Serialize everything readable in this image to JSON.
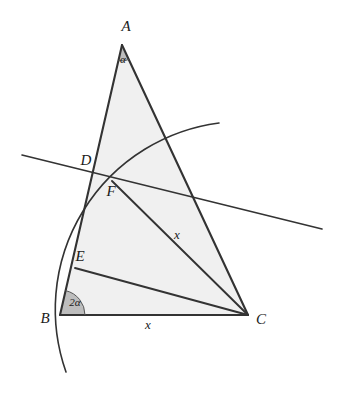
{
  "figure": {
    "type": "euclidean-geometry-diagram",
    "title": "",
    "background_color": "#ffffff",
    "stroke_color": "#333333",
    "triangle_fill": "#f0f0f0",
    "angle_sector_fill": "#bdbdbd",
    "vertices": [
      {
        "name": "A",
        "label": "A",
        "x": 122,
        "y": 45,
        "label_x": 126,
        "label_y": 28
      },
      {
        "name": "B",
        "label": "B",
        "x": 60,
        "y": 315,
        "label_x": 45,
        "label_y": 320
      },
      {
        "name": "C",
        "label": "C",
        "x": 248,
        "y": 315,
        "label_x": 261,
        "label_y": 321
      }
    ],
    "points": [
      {
        "name": "D",
        "label": "D",
        "x": 93,
        "y": 172,
        "label_x": 86,
        "label_y": 162
      },
      {
        "name": "E",
        "label": "E",
        "x": 75,
        "y": 268,
        "label_x": 80,
        "label_y": 258
      },
      {
        "name": "F",
        "label": "F",
        "x": 112,
        "y": 181,
        "label_x": 111,
        "label_y": 193
      }
    ],
    "segments": [
      {
        "name": "side-AB",
        "from": "A",
        "to": "B"
      },
      {
        "name": "side-BC",
        "from": "B",
        "to": "C"
      },
      {
        "name": "side-CA",
        "from": "C",
        "to": "A"
      },
      {
        "name": "cevian-FC",
        "from": "F",
        "to": "C"
      },
      {
        "name": "cevian-EC",
        "from": "E",
        "to": "C"
      }
    ],
    "angles": [
      {
        "name": "angle-at-A",
        "label": "α",
        "vertex": "A",
        "label_x": 123,
        "label_y": 60,
        "radius": 16
      },
      {
        "name": "angle-at-B",
        "label": "2α",
        "vertex": "B",
        "label_x": 75,
        "label_y": 303,
        "radius": 25
      }
    ],
    "measures": [
      {
        "name": "length-label-FC",
        "label": "x",
        "x": 177,
        "y": 236
      },
      {
        "name": "length-label-BC",
        "label": "x",
        "x": 148,
        "y": 326
      }
    ],
    "arc": {
      "name": "circular-arc-centered-at-C",
      "label": "",
      "start_x": 219,
      "start_y": 123,
      "end_x": 66,
      "end_y": 372,
      "through_x": 112,
      "through_y": 181,
      "radius": 188
    },
    "transversal": {
      "name": "transversal-line-through-D-and-F",
      "label": "",
      "start_x": 22,
      "start_y": 155,
      "end_x": 322,
      "end_y": 229
    }
  }
}
